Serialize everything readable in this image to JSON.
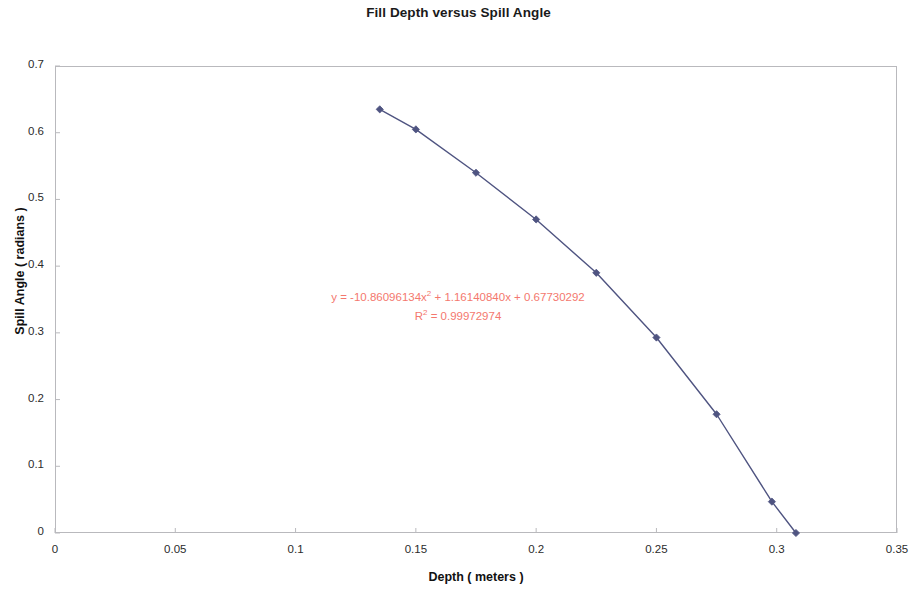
{
  "chart_data": {
    "type": "line",
    "title": "Fill Depth versus Spill Angle",
    "xlabel": "Depth ( meters )",
    "ylabel": "Spill Angle ( radians )",
    "xlim": [
      0,
      0.35
    ],
    "ylim": [
      0,
      0.7
    ],
    "xticks": [
      "0",
      "0.05",
      "0.1",
      "0.15",
      "0.2",
      "0.25",
      "0.3",
      "0.35"
    ],
    "xtick_values": [
      0,
      0.05,
      0.1,
      0.15,
      0.2,
      0.25,
      0.3,
      0.35
    ],
    "yticks": [
      "0",
      "0.1",
      "0.2",
      "0.3",
      "0.4",
      "0.5",
      "0.6",
      "0.7"
    ],
    "ytick_values": [
      0,
      0.1,
      0.2,
      0.3,
      0.4,
      0.5,
      0.6,
      0.7
    ],
    "grid": false,
    "legend": false,
    "series": [
      {
        "name": "Fill Depth versus Spill Angle",
        "marker": "diamond",
        "color": "#4f5481",
        "x": [
          0.135,
          0.15,
          0.175,
          0.2,
          0.225,
          0.25,
          0.275,
          0.298,
          0.308
        ],
        "y": [
          0.635,
          0.605,
          0.54,
          0.47,
          0.39,
          0.293,
          0.178,
          0.047,
          0.0
        ]
      }
    ],
    "annotations": {
      "equation_prefix": "y = -10.86096134x",
      "equation_exponent": "2",
      "equation_suffix": " + 1.16140840x + 0.67730292",
      "r2_prefix": "R",
      "r2_exponent": "2",
      "r2_suffix": " = 0.99972974",
      "color": "#f4786e"
    },
    "colors": {
      "series": "#4f5481",
      "annotation": "#f4786e",
      "axis": "#b9b9bd",
      "text": "#111111"
    }
  }
}
